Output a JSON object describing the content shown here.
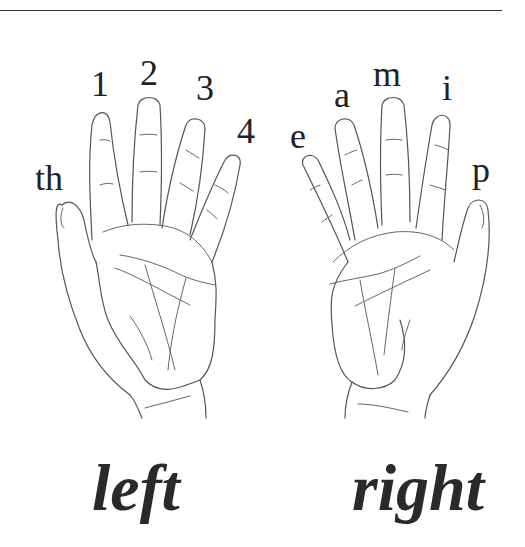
{
  "figure": {
    "left_hand": {
      "caption": "left",
      "finger_labels": [
        {
          "finger": "thumb",
          "label": "th",
          "x": 35,
          "y": 160
        },
        {
          "finger": "index",
          "label": "1",
          "x": 91,
          "y": 96
        },
        {
          "finger": "middle",
          "label": "2",
          "x": 140,
          "y": 80
        },
        {
          "finger": "ring",
          "label": "3",
          "x": 196,
          "y": 100
        },
        {
          "finger": "little",
          "label": "4",
          "x": 237,
          "y": 118
        }
      ]
    },
    "right_hand": {
      "caption": "right",
      "finger_labels": [
        {
          "finger": "little",
          "label": "e",
          "x": 290,
          "y": 118
        },
        {
          "finger": "ring",
          "label": "a",
          "x": 334,
          "y": 80
        },
        {
          "finger": "middle",
          "label": "m",
          "x": 373,
          "y": 68
        },
        {
          "finger": "index",
          "label": "i",
          "x": 442,
          "y": 80
        },
        {
          "finger": "thumb",
          "label": "p",
          "x": 472,
          "y": 152
        }
      ]
    }
  }
}
